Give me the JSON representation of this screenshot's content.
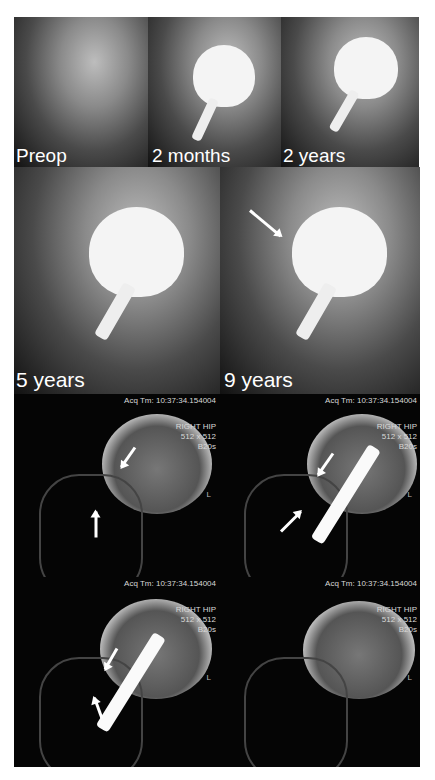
{
  "figure": {
    "xray_panels": [
      {
        "label": "Preop"
      },
      {
        "label": "2 months"
      },
      {
        "label": "2 years"
      },
      {
        "label": "5 years"
      },
      {
        "label": "9 years"
      }
    ],
    "ct_panels": [
      {
        "acq": "Acq Tm: 10:37:34.154004",
        "line1": "RIGHT HIP",
        "line2": "512 x 512",
        "line3": "B20s",
        "marker": "L"
      },
      {
        "acq": "Acq Tm: 10:37:34.154004",
        "line1": "RIGHT HIP",
        "line2": "512 x 512",
        "line3": "B20s",
        "marker": "L"
      },
      {
        "acq": "Acq Tm: 10:37:34.154004",
        "line1": "RIGHT HIP",
        "line2": "512 x 512",
        "line3": "B20s",
        "marker": "L"
      },
      {
        "acq": "Acq Tm: 10:37:34.154004",
        "line1": "RIGHT HIP",
        "line2": "512 x 512",
        "line3": "B20s",
        "marker": "L"
      }
    ]
  }
}
